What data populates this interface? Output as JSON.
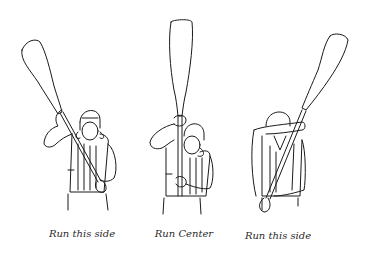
{
  "illustration": {
    "subject": "paddle signals",
    "colors": {
      "background": "#ffffff",
      "ink": "#1a1a1a",
      "caption": "#2a2a2a"
    },
    "figures": [
      {
        "id": "left",
        "caption": "Run this side",
        "paddle_direction": "tilted-left"
      },
      {
        "id": "center",
        "caption": "Run Center",
        "paddle_direction": "vertical"
      },
      {
        "id": "right",
        "caption": "Run this side",
        "paddle_direction": "tilted-right"
      }
    ]
  }
}
